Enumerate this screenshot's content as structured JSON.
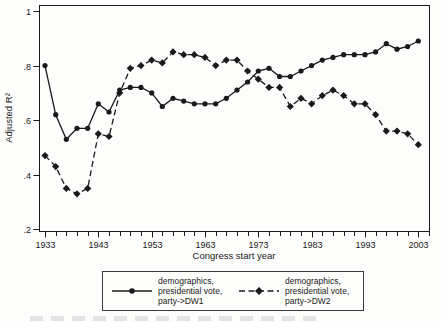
{
  "figure": {
    "background": "#fdfdfc",
    "ink_color": "#1a1a1a",
    "y_axis": {
      "title": "Adjusted R²",
      "tick_labels": [
        "1",
        ".8",
        ".6",
        ".4",
        ".2"
      ],
      "tick_values": [
        1,
        0.8,
        0.6,
        0.4,
        0.2
      ]
    },
    "x_axis": {
      "title": "Congress start year",
      "major_tick_labels": [
        "1933",
        "1943",
        "1953",
        "1963",
        "1973",
        "1983",
        "1993",
        "2003"
      ],
      "major_tick_values": [
        1933,
        1943,
        1953,
        1963,
        1973,
        1983,
        1993,
        2003
      ],
      "minor_tick_step_years": 2,
      "minor_tick_range": [
        1933,
        2005
      ]
    }
  },
  "legend": {
    "entries": [
      {
        "label_multiline": "demographics,\npresidential vote,\nparty->DW1",
        "marker": "circle",
        "line_style": "solid"
      },
      {
        "label_multiline": "demographics,\npresidential vote,\nparty->DW2",
        "marker": "diamond",
        "line_style": "dashed"
      }
    ]
  },
  "chart_data": {
    "type": "line",
    "title": "",
    "xlabel": "Congress start year",
    "ylabel": "Adjusted R²",
    "xlim": [
      1931,
      2005
    ],
    "ylim": [
      0.2,
      1.0
    ],
    "grid": false,
    "legend_position": "bottom",
    "x": [
      1933,
      1935,
      1937,
      1939,
      1941,
      1943,
      1945,
      1947,
      1949,
      1951,
      1953,
      1955,
      1957,
      1959,
      1961,
      1963,
      1965,
      1967,
      1969,
      1971,
      1973,
      1975,
      1977,
      1979,
      1981,
      1983,
      1985,
      1987,
      1989,
      1991,
      1993,
      1995,
      1997,
      1999,
      2001,
      2003
    ],
    "series": [
      {
        "name": "demographics, presidential vote, party->DW1",
        "label_multiline": "demographics,\npresidential vote,\nparty->DW1",
        "marker": "circle",
        "line_style": "solid",
        "values": [
          0.8,
          0.62,
          0.53,
          0.57,
          0.57,
          0.66,
          0.63,
          0.71,
          0.72,
          0.72,
          0.7,
          0.65,
          0.68,
          0.67,
          0.66,
          0.66,
          0.66,
          0.68,
          0.71,
          0.74,
          0.78,
          0.79,
          0.76,
          0.76,
          0.78,
          0.8,
          0.82,
          0.83,
          0.84,
          0.84,
          0.84,
          0.85,
          0.88,
          0.86,
          0.87,
          0.89
        ]
      },
      {
        "name": "demographics, presidential vote, party->DW2",
        "label_multiline": "demographics,\npresidential vote,\nparty->DW2",
        "marker": "diamond",
        "line_style": "dashed",
        "values": [
          0.47,
          0.43,
          0.35,
          0.33,
          0.35,
          0.55,
          0.54,
          0.7,
          0.79,
          0.8,
          0.82,
          0.81,
          0.85,
          0.84,
          0.84,
          0.83,
          0.8,
          0.82,
          0.82,
          0.78,
          0.75,
          0.72,
          0.72,
          0.65,
          0.68,
          0.66,
          0.69,
          0.71,
          0.69,
          0.66,
          0.66,
          0.62,
          0.56,
          0.56,
          0.55,
          0.51
        ]
      }
    ]
  }
}
